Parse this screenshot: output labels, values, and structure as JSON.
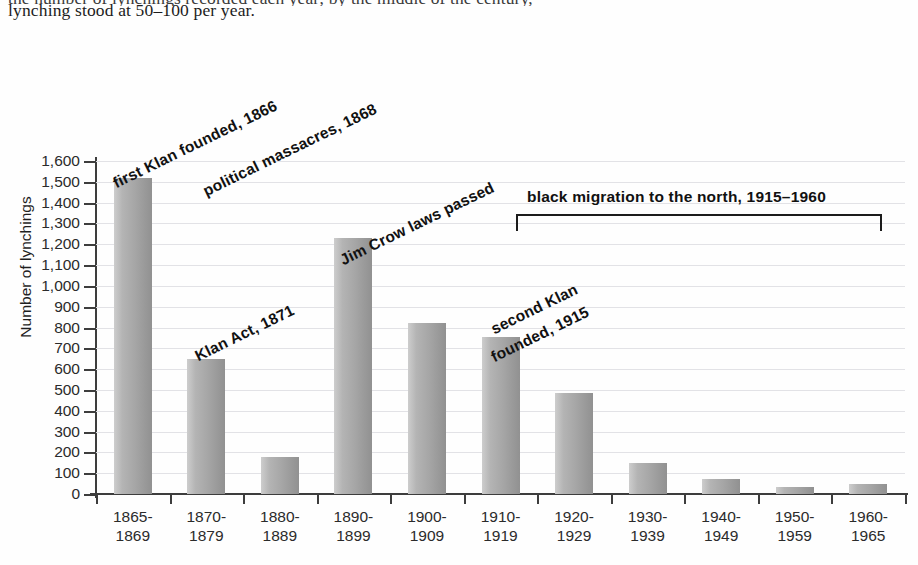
{
  "prose": {
    "clipped_line": "the number of lynchings recorded each year; by the middle of the century,",
    "line": "lynching stood at 50–100 per year."
  },
  "chart_data": {
    "type": "bar",
    "title": "",
    "xlabel": "",
    "ylabel": "Number of lynchings",
    "ylim": [
      0,
      1600
    ],
    "ytick_step": 100,
    "grid": true,
    "legend": "none",
    "bar_color": "#a8a8a8",
    "categories": [
      "1865-\n1869",
      "1870-\n1879",
      "1880-\n1889",
      "1890-\n1899",
      "1900-\n1909",
      "1910-\n1919",
      "1920-\n1929",
      "1930-\n1939",
      "1940-\n1949",
      "1950-\n1959",
      "1960-\n1965"
    ],
    "category_lines": [
      [
        "1865-",
        "1869"
      ],
      [
        "1870-",
        "1879"
      ],
      [
        "1880-",
        "1889"
      ],
      [
        "1890-",
        "1899"
      ],
      [
        "1900-",
        "1909"
      ],
      [
        "1910-",
        "1919"
      ],
      [
        "1920-",
        "1929"
      ],
      [
        "1930-",
        "1939"
      ],
      [
        "1940-",
        "1949"
      ],
      [
        "1950-",
        "1959"
      ],
      [
        "1960-",
        "1965"
      ]
    ],
    "values": [
      1520,
      650,
      180,
      1230,
      820,
      755,
      485,
      150,
      70,
      35,
      50
    ],
    "ytick_labels": [
      "0",
      "100",
      "200",
      "300",
      "400",
      "500",
      "600",
      "700",
      "800",
      "900",
      "1,000",
      "1,100",
      "1,200",
      "1,300",
      "1,400",
      "1,500",
      "1,600"
    ],
    "ytick_values": [
      0,
      100,
      200,
      300,
      400,
      500,
      600,
      700,
      800,
      900,
      1000,
      1100,
      1200,
      1300,
      1400,
      1500,
      1600
    ],
    "annotations": [
      {
        "id": "first-klan",
        "text": "first Klan founded, 1866",
        "rotated": true
      },
      {
        "id": "political-massacres",
        "text": "political massacres, 1868",
        "rotated": true
      },
      {
        "id": "klan-act",
        "text": "Klan Act, 1871",
        "rotated": true
      },
      {
        "id": "jim-crow",
        "text": "Jim Crow laws passed",
        "rotated": true
      },
      {
        "id": "second-klan-line1",
        "text": "second Klan",
        "rotated": true
      },
      {
        "id": "second-klan-line2",
        "text": "founded, 1915",
        "rotated": true
      },
      {
        "id": "black-migration",
        "text": "black migration to the north, 1915–1960",
        "rotated": false,
        "bracket": true
      }
    ]
  }
}
